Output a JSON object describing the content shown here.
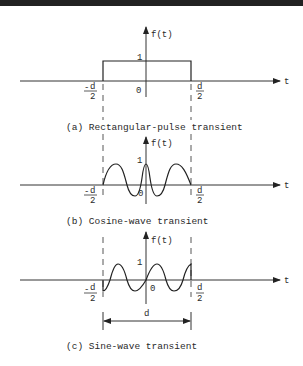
{
  "figure": {
    "panels": [
      {
        "id": "a",
        "caption": "(a) Rectangular-pulse transient",
        "y_axis_label": "f(t)",
        "x_axis_label": "t",
        "amplitude_label": "1",
        "origin_label": "0",
        "left_bound": {
          "sign": "-",
          "num": "d",
          "den": "2"
        },
        "right_bound": {
          "num": "d",
          "den": "2"
        }
      },
      {
        "id": "b",
        "caption": "(b) Cosine-wave transient",
        "y_axis_label": "f(t)",
        "x_axis_label": "t",
        "amplitude_label": "1",
        "origin_label": "0",
        "left_bound": {
          "sign": "-",
          "num": "d",
          "den": "2"
        },
        "right_bound": {
          "num": "d",
          "den": "2"
        }
      },
      {
        "id": "c",
        "caption": "(c) Sine-wave transient",
        "y_axis_label": "f(t)",
        "x_axis_label": "t",
        "amplitude_label": "1",
        "origin_label": "0",
        "left_bound": {
          "sign": "-",
          "num": "d",
          "den": "2"
        },
        "right_bound": {
          "num": "d",
          "den": "2"
        },
        "width_label": "d"
      }
    ]
  },
  "colors": {
    "ink": "#222222",
    "background": "#ffffff",
    "top_bar": "#222222"
  }
}
